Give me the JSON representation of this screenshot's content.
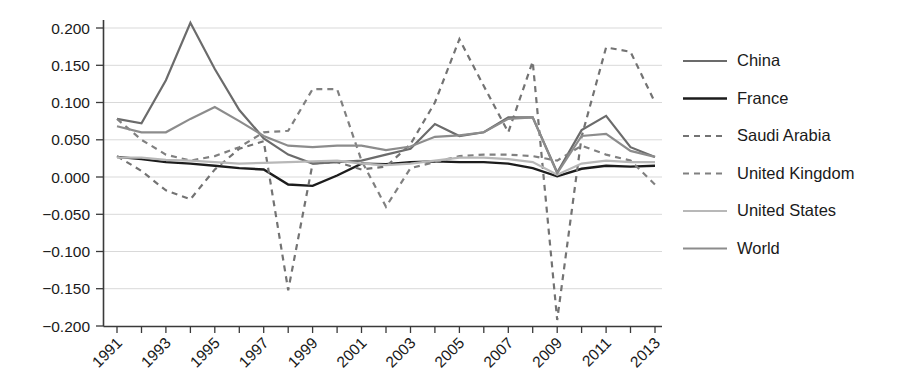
{
  "chart_data": {
    "type": "line",
    "title": "",
    "xlabel": "",
    "ylabel": "",
    "xlim": [
      1991,
      2013
    ],
    "ylim": [
      -0.2,
      0.2
    ],
    "grid": true,
    "legend_position": "right",
    "ytick_labels": [
      "0.200",
      "0.150",
      "0.100",
      "0.050",
      "0.000",
      "-0.050",
      "-0.100",
      "-0.150",
      "-0.200"
    ],
    "ytick_values": [
      0.2,
      0.15,
      0.1,
      0.05,
      0.0,
      -0.05,
      -0.1,
      -0.15,
      -0.2
    ],
    "xtick_labels": [
      "1991",
      "1993",
      "1995",
      "1997",
      "1999",
      "2001",
      "2003",
      "2005",
      "2007",
      "2009",
      "2011",
      "2013"
    ],
    "xtick_values": [
      1991,
      1993,
      1995,
      1997,
      1999,
      2001,
      2003,
      2005,
      2007,
      2009,
      2011,
      2013
    ],
    "x": [
      1991,
      1992,
      1993,
      1994,
      1995,
      1996,
      1997,
      1998,
      1999,
      2000,
      2001,
      2002,
      2003,
      2004,
      2005,
      2006,
      2007,
      2008,
      2009,
      2010,
      2011,
      2012,
      2013
    ],
    "series": [
      {
        "name": "China",
        "color": "#6b6b6b",
        "style": "solid",
        "width": 2.2,
        "values": [
          0.078,
          0.072,
          0.13,
          0.207,
          0.145,
          0.09,
          0.052,
          0.03,
          0.018,
          0.02,
          0.022,
          0.03,
          0.038,
          0.071,
          0.055,
          0.06,
          0.08,
          0.08,
          0.006,
          0.063,
          0.082,
          0.04,
          0.027
        ]
      },
      {
        "name": "France",
        "color": "#1c1c1c",
        "style": "solid",
        "width": 2.4,
        "values": [
          0.027,
          0.024,
          0.02,
          0.018,
          0.015,
          0.012,
          0.01,
          -0.01,
          -0.012,
          0.002,
          0.018,
          0.017,
          0.02,
          0.021,
          0.02,
          0.02,
          0.018,
          0.012,
          0.001,
          0.011,
          0.015,
          0.014,
          0.015
        ]
      },
      {
        "name": "Saudi Arabia",
        "color": "#737373",
        "style": "dashed",
        "width": 2.2,
        "values": [
          0.028,
          0.008,
          -0.018,
          -0.03,
          0.01,
          0.038,
          0.048,
          -0.152,
          0.018,
          0.02,
          0.01,
          0.014,
          0.044,
          0.1,
          0.185,
          0.122,
          0.06,
          0.155,
          -0.192,
          0.054,
          0.174,
          0.168,
          0.1
        ]
      },
      {
        "name": "United Kingdom",
        "color": "#808080",
        "style": "dashed",
        "width": 2.2,
        "values": [
          0.078,
          0.05,
          0.03,
          0.022,
          0.028,
          0.04,
          0.06,
          0.062,
          0.118,
          0.118,
          0.022,
          -0.04,
          0.012,
          0.02,
          0.028,
          0.03,
          0.03,
          0.028,
          0.022,
          0.042,
          0.03,
          0.022,
          -0.01
        ]
      },
      {
        "name": "United States",
        "color": "#b8b8b8",
        "style": "solid",
        "width": 2.2,
        "values": [
          0.026,
          0.026,
          0.023,
          0.022,
          0.02,
          0.018,
          0.019,
          0.02,
          0.021,
          0.022,
          0.018,
          0.016,
          0.018,
          0.022,
          0.026,
          0.026,
          0.024,
          0.02,
          0.003,
          0.018,
          0.022,
          0.02,
          0.02
        ]
      },
      {
        "name": "World",
        "color": "#8c8c8c",
        "style": "solid",
        "width": 2.2,
        "values": [
          0.068,
          0.06,
          0.06,
          0.078,
          0.094,
          0.075,
          0.055,
          0.042,
          0.04,
          0.042,
          0.042,
          0.036,
          0.041,
          0.054,
          0.056,
          0.06,
          0.078,
          0.08,
          0.005,
          0.055,
          0.058,
          0.035,
          0.027
        ]
      }
    ]
  },
  "legend": {
    "items": [
      {
        "label": "China"
      },
      {
        "label": "France"
      },
      {
        "label": "Saudi Arabia"
      },
      {
        "label": "United Kingdom"
      },
      {
        "label": "United States"
      },
      {
        "label": "World"
      }
    ]
  }
}
